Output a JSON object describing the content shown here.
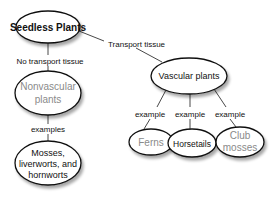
{
  "diagram": {
    "type": "concept-map",
    "nodes": {
      "root": {
        "label": "Seedless Plants"
      },
      "nonvascular": {
        "lines": [
          "Nonvascular",
          "plants"
        ]
      },
      "mosses": {
        "lines": [
          "Mosses,",
          "liverworts, and",
          "hornworts"
        ]
      },
      "vascular": {
        "label": "Vascular plants"
      },
      "ferns": {
        "label": "Ferns"
      },
      "horsetails": {
        "label": "Horsetails"
      },
      "club_mosses": {
        "lines": [
          "Club",
          "mosses"
        ]
      }
    },
    "edges": {
      "root_to_vascular": "Transport tissue",
      "root_to_nonvascular": "No transport tissue",
      "nonvascular_to_mosses": "examples",
      "vascular_to_ferns": "example",
      "vascular_to_horsetails": "example",
      "vascular_to_club_mosses": "example"
    },
    "colors": {
      "stroke": "#111111",
      "emphasis_text": "#111111",
      "muted_text": "#8a8a8a"
    }
  }
}
